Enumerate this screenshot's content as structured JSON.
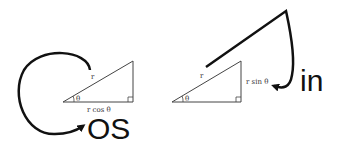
{
  "left_diagram": {
    "hypotenuse_label": "r",
    "angle_label": "θ",
    "base_label": "r cos θ",
    "suffix_text": "OS"
  },
  "right_diagram": {
    "hypotenuse_label": "r",
    "angle_label": "θ",
    "side_label": "r sin θ",
    "suffix_text": "in"
  },
  "colors": {
    "stroke": "#111111",
    "thin_stroke": "#444444",
    "background": "#ffffff"
  }
}
